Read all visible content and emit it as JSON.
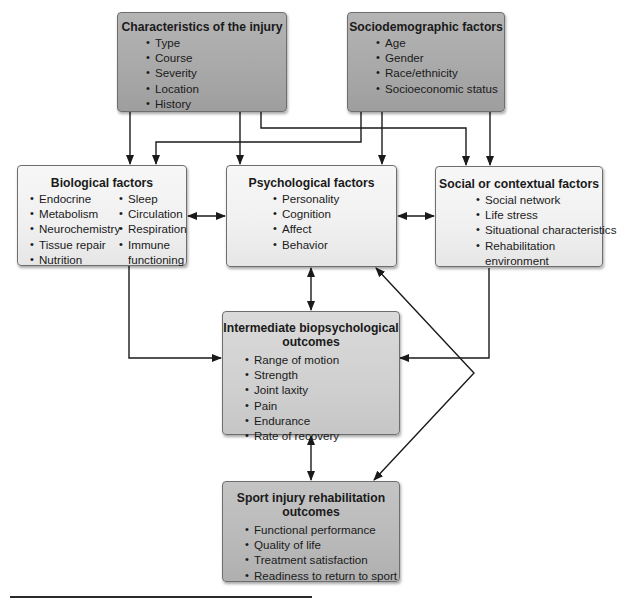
{
  "diagram": {
    "boxes": {
      "injury": {
        "title": "Characteristics of the injury",
        "items": [
          "Type",
          "Course",
          "Severity",
          "Location",
          "History"
        ]
      },
      "sociodemographic": {
        "title": "Sociodemographic factors",
        "items": [
          "Age",
          "Gender",
          "Race/ethnicity",
          "Socioeconomic status"
        ]
      },
      "biological": {
        "title": "Biological factors",
        "col1": [
          "Endocrine",
          "Metabolism",
          "Neurochemistry",
          "Tissue repair",
          "Nutrition"
        ],
        "col2": [
          "Sleep",
          "Circulation",
          "Respiration",
          "Immune",
          "functioning"
        ]
      },
      "psychological": {
        "title": "Psychological factors",
        "items": [
          "Personality",
          "Cognition",
          "Affect",
          "Behavior"
        ]
      },
      "social": {
        "title": "Social or contextual factors",
        "items": [
          "Social network",
          "Life stress",
          "Situational characteristics",
          "Rehabilitation",
          "environment"
        ]
      },
      "intermediate": {
        "title_line1": "Intermediate biopsychological",
        "title_line2": "outcomes",
        "items": [
          "Range of motion",
          "Strength",
          "Joint laxity",
          "Pain",
          "Endurance",
          "Rate of recovery"
        ]
      },
      "rehab": {
        "title_line1": "Sport injury rehabilitation",
        "title_line2": "outcomes",
        "items": [
          "Functional performance",
          "Quality of life",
          "Treatment satisfaction",
          "Readiness to return to sport"
        ]
      }
    },
    "connections": [
      {
        "from": "injury",
        "to": "biological",
        "type": "one-way"
      },
      {
        "from": "injury",
        "to": "psychological",
        "type": "one-way"
      },
      {
        "from": "injury",
        "to": "social",
        "type": "one-way"
      },
      {
        "from": "sociodemographic",
        "to": "biological",
        "type": "one-way"
      },
      {
        "from": "sociodemographic",
        "to": "psychological",
        "type": "one-way"
      },
      {
        "from": "sociodemographic",
        "to": "social",
        "type": "one-way"
      },
      {
        "from": "biological",
        "to": "psychological",
        "type": "two-way"
      },
      {
        "from": "psychological",
        "to": "social",
        "type": "two-way"
      },
      {
        "from": "psychological",
        "to": "intermediate",
        "type": "two-way"
      },
      {
        "from": "biological",
        "to": "intermediate",
        "type": "one-way"
      },
      {
        "from": "social",
        "to": "intermediate",
        "type": "one-way"
      },
      {
        "from": "intermediate",
        "to": "rehab",
        "type": "two-way"
      },
      {
        "from": "psychological",
        "to": "rehab",
        "type": "two-way"
      }
    ],
    "colors": {
      "dark_box": "#a9a9a9",
      "mid_box": "#d0d0d0",
      "midd_box": "#b9b9b9",
      "light_box": "#f0f0f0",
      "line": "#1a1a1a"
    }
  }
}
